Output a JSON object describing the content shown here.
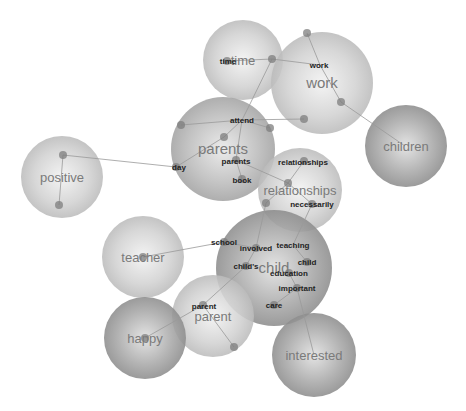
{
  "diagram": {
    "title": "",
    "colors": {
      "bubble_light": "#e6e6e6",
      "bubble_mid": "#b8b8b8",
      "bubble_dark": "#8e8e8e",
      "node": "#7d7d7d",
      "edge": "#9a9a9a",
      "cluster_text": "#7a7a7a",
      "word_text": "#1e1e1e"
    },
    "clusters": [
      {
        "id": "time",
        "label": "time",
        "cx": 243,
        "cy": 60,
        "r": 40,
        "shade": "light"
      },
      {
        "id": "work",
        "label": "work",
        "cx": 322,
        "cy": 83,
        "r": 51,
        "shade": "light"
      },
      {
        "id": "children",
        "label": "children",
        "cx": 406,
        "cy": 146,
        "r": 41,
        "shade": "dark"
      },
      {
        "id": "parents",
        "label": "parents",
        "cx": 223,
        "cy": 149,
        "r": 52,
        "shade": "mid"
      },
      {
        "id": "positive",
        "label": "positive",
        "cx": 62,
        "cy": 177,
        "r": 41,
        "shade": "light"
      },
      {
        "id": "relationships",
        "label": "relationships",
        "cx": 300,
        "cy": 190,
        "r": 42,
        "shade": "light"
      },
      {
        "id": "teacher",
        "label": "teacher",
        "cx": 143,
        "cy": 257,
        "r": 41,
        "shade": "light"
      },
      {
        "id": "child",
        "label": "child",
        "cx": 274,
        "cy": 268,
        "r": 58,
        "shade": "dark"
      },
      {
        "id": "parent",
        "label": "parent",
        "cx": 213,
        "cy": 316,
        "r": 41,
        "shade": "light"
      },
      {
        "id": "happy",
        "label": "happy",
        "cx": 145,
        "cy": 338,
        "r": 41,
        "shade": "dark"
      },
      {
        "id": "interested",
        "label": "interested",
        "cx": 314,
        "cy": 355,
        "r": 42,
        "shade": "dark"
      }
    ],
    "words": [
      {
        "id": "w-time",
        "label": "time",
        "x": 228,
        "y": 61
      },
      {
        "id": "w-work",
        "label": "work",
        "x": 319,
        "y": 65
      },
      {
        "id": "w-attend",
        "label": "attend",
        "x": 242,
        "y": 120
      },
      {
        "id": "w-parents",
        "label": "parents",
        "x": 236,
        "y": 161
      },
      {
        "id": "w-day",
        "label": "day",
        "x": 179,
        "y": 167
      },
      {
        "id": "w-book",
        "label": "book",
        "x": 242,
        "y": 180
      },
      {
        "id": "w-relationships",
        "label": "relationships",
        "x": 303,
        "y": 162
      },
      {
        "id": "w-necessarily",
        "label": "necessarily",
        "x": 312,
        "y": 204
      },
      {
        "id": "w-school",
        "label": "school",
        "x": 224,
        "y": 242
      },
      {
        "id": "w-involved",
        "label": "involved",
        "x": 256,
        "y": 248
      },
      {
        "id": "w-teaching",
        "label": "teaching",
        "x": 293,
        "y": 245
      },
      {
        "id": "w-child",
        "label": "child",
        "x": 307,
        "y": 262
      },
      {
        "id": "w-childs",
        "label": "child's",
        "x": 246,
        "y": 266
      },
      {
        "id": "w-education",
        "label": "education",
        "x": 289,
        "y": 273
      },
      {
        "id": "w-important",
        "label": "important",
        "x": 297,
        "y": 288
      },
      {
        "id": "w-care",
        "label": "care",
        "x": 274,
        "y": 305
      },
      {
        "id": "w-parent",
        "label": "parent",
        "x": 204,
        "y": 306
      }
    ],
    "nodes": [
      {
        "x": 227,
        "y": 61
      },
      {
        "x": 272,
        "y": 59
      },
      {
        "x": 307,
        "y": 33
      },
      {
        "x": 341,
        "y": 102
      },
      {
        "x": 304,
        "y": 119
      },
      {
        "x": 181,
        "y": 125
      },
      {
        "x": 270,
        "y": 128
      },
      {
        "x": 224,
        "y": 137
      },
      {
        "x": 236,
        "y": 160
      },
      {
        "x": 176,
        "y": 167
      },
      {
        "x": 242,
        "y": 179
      },
      {
        "x": 63,
        "y": 155
      },
      {
        "x": 59,
        "y": 205
      },
      {
        "x": 304,
        "y": 161
      },
      {
        "x": 288,
        "y": 183
      },
      {
        "x": 266,
        "y": 203
      },
      {
        "x": 312,
        "y": 204
      },
      {
        "x": 224,
        "y": 242
      },
      {
        "x": 256,
        "y": 248
      },
      {
        "x": 246,
        "y": 266
      },
      {
        "x": 307,
        "y": 262
      },
      {
        "x": 289,
        "y": 273
      },
      {
        "x": 297,
        "y": 288
      },
      {
        "x": 274,
        "y": 305
      },
      {
        "x": 203,
        "y": 305
      },
      {
        "x": 234,
        "y": 347
      },
      {
        "x": 143,
        "y": 257
      },
      {
        "x": 145,
        "y": 338
      }
    ],
    "edges": [
      [
        227,
        61,
        272,
        59
      ],
      [
        272,
        59,
        320,
        65
      ],
      [
        307,
        33,
        320,
        65
      ],
      [
        320,
        65,
        341,
        102
      ],
      [
        341,
        102,
        405,
        146
      ],
      [
        272,
        59,
        250,
        104
      ],
      [
        250,
        104,
        242,
        120
      ],
      [
        181,
        125,
        242,
        120
      ],
      [
        242,
        120,
        270,
        128
      ],
      [
        242,
        120,
        304,
        119
      ],
      [
        242,
        120,
        224,
        137
      ],
      [
        224,
        137,
        176,
        167
      ],
      [
        242,
        120,
        236,
        160
      ],
      [
        236,
        160,
        242,
        179
      ],
      [
        63,
        155,
        176,
        167
      ],
      [
        63,
        155,
        59,
        205
      ],
      [
        236,
        160,
        288,
        183
      ],
      [
        304,
        161,
        288,
        183
      ],
      [
        288,
        183,
        312,
        204
      ],
      [
        288,
        183,
        266,
        203
      ],
      [
        312,
        204,
        293,
        245
      ],
      [
        266,
        203,
        256,
        248
      ],
      [
        143,
        257,
        224,
        242
      ],
      [
        224,
        242,
        256,
        248
      ],
      [
        256,
        248,
        246,
        266
      ],
      [
        293,
        245,
        307,
        262
      ],
      [
        289,
        273,
        297,
        288
      ],
      [
        297,
        288,
        314,
        355
      ],
      [
        297,
        288,
        274,
        305
      ],
      [
        246,
        266,
        203,
        305
      ],
      [
        203,
        305,
        145,
        338
      ],
      [
        203,
        305,
        234,
        347
      ]
    ]
  }
}
